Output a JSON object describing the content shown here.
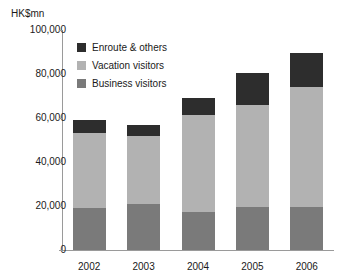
{
  "axis": {
    "unit_label": "HK$mn",
    "y_ticks": [
      "100,000",
      "80,000",
      "60,000",
      "40,000",
      "20,000",
      "0"
    ],
    "x_ticks": [
      "2002",
      "2003",
      "2004",
      "2005",
      "2006"
    ]
  },
  "legend": {
    "items": [
      {
        "label": "Enroute & others",
        "color": "#2d2d2d"
      },
      {
        "label": "Vacation visitors",
        "color": "#b2b2b2"
      },
      {
        "label": "Business visitors",
        "color": "#7a7a7a"
      }
    ]
  },
  "colors": {
    "enroute": "#2d2d2d",
    "vacation": "#b2b2b2",
    "business": "#7a7a7a",
    "axis": "#9a9a9a",
    "background": "#ffffff",
    "text": "#1a1a1a"
  },
  "chart_data": {
    "type": "bar",
    "stacked": true,
    "title": "",
    "xlabel": "",
    "ylabel": "HK$mn",
    "ylim": [
      0,
      100000
    ],
    "ytick_step": 20000,
    "grid": false,
    "legend_position": "inside-top-left",
    "categories": [
      "2002",
      "2003",
      "2004",
      "2005",
      "2006"
    ],
    "series": [
      {
        "name": "Business visitors",
        "color": "#7a7a7a",
        "values": [
          19000,
          21000,
          17500,
          19500,
          19500
        ]
      },
      {
        "name": "Vacation visitors",
        "color": "#b2b2b2",
        "values": [
          34000,
          31000,
          44000,
          46500,
          54500
        ]
      },
      {
        "name": "Enroute & others",
        "color": "#2d2d2d",
        "values": [
          6000,
          5000,
          7500,
          14500,
          15500
        ]
      }
    ],
    "totals": [
      59000,
      57000,
      69000,
      80500,
      89500
    ]
  }
}
